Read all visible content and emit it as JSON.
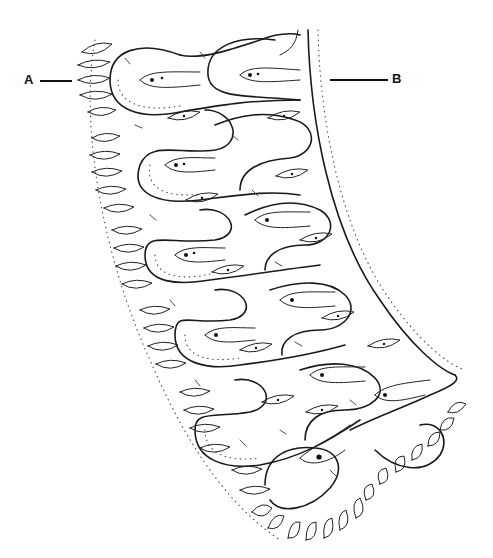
{
  "figure": {
    "type": "line-drawing",
    "colors": {
      "ink": "#1a1a1a",
      "background": "#ffffff"
    },
    "labels": [
      {
        "id": "A",
        "text": "A",
        "points_to": "left margin spindle cells"
      },
      {
        "id": "B",
        "text": "B",
        "points_to": "right smooth boundary layer"
      }
    ],
    "loops": [
      {
        "cx": 150,
        "cy": 80
      },
      {
        "cx": 255,
        "cy": 75
      },
      {
        "cx": 185,
        "cy": 165
      },
      {
        "cx": 280,
        "cy": 150
      },
      {
        "cx": 190,
        "cy": 245
      },
      {
        "cx": 300,
        "cy": 220
      },
      {
        "cx": 210,
        "cy": 320
      },
      {
        "cx": 320,
        "cy": 295
      },
      {
        "cx": 240,
        "cy": 400
      },
      {
        "cx": 345,
        "cy": 375
      },
      {
        "cx": 320,
        "cy": 460
      },
      {
        "cx": 400,
        "cy": 440
      }
    ]
  }
}
